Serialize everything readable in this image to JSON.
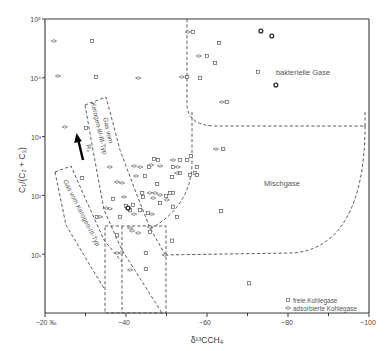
{
  "chart_data": {
    "type": "scatter",
    "title": "",
    "xlabel": "δ¹³CCH₄",
    "ylabel": "C₁/(C₂ + C₃)",
    "xlim": [
      -20,
      -100
    ],
    "ylim": [
      1,
      100000
    ],
    "yscale": "log",
    "grid": false,
    "legend_position": "bottom-right",
    "xtick_labels": [
      "−20 ‰",
      "−40",
      "−60",
      "−80",
      "−100"
    ],
    "xticks_major": [
      -20,
      -40,
      -60,
      -80,
      -100
    ],
    "xticks_minor": [
      -30,
      -50,
      -70,
      -90
    ],
    "ytick_labels": [
      "10⁵",
      "10⁴",
      "10³",
      "10²",
      "10¹"
    ],
    "yticks": [
      100000,
      10000,
      1000,
      100,
      10
    ],
    "legend": [
      {
        "symbol": "square",
        "label": "freie Kohlegase"
      },
      {
        "symbol": "diamond",
        "label": "adsorbierte Kohlegase"
      }
    ],
    "annotations": {
      "bacterial": "bakterielle Gase",
      "mixed": "Mischgase",
      "kerogen_2_3_line1": "Gas vom",
      "kerogen_2_3_line2": "Kerogen-II/-III-Typ",
      "kerogen_3": "Gas vom Kerogen-III-Typ",
      "maturity_arrow": "Rₒ"
    },
    "series": [
      {
        "name": "freie Kohlegase",
        "symbol": "square",
        "points": [
          [
            -31.6,
            42300
          ],
          [
            -32.6,
            10300
          ],
          [
            -55.1,
            10300
          ],
          [
            -56.5,
            60100
          ],
          [
            -63.0,
            39100
          ],
          [
            -60.0,
            23500
          ],
          [
            -62.0,
            17900
          ],
          [
            -58.3,
            9930
          ],
          [
            -72.6,
            12600
          ],
          [
            -64.9,
            3870
          ],
          [
            -64.0,
            615
          ],
          [
            -63.5,
            54
          ],
          [
            -30.1,
            1400
          ],
          [
            -29.1,
            198
          ],
          [
            -36.8,
            87
          ],
          [
            -32.8,
            43
          ],
          [
            -38.5,
            43
          ],
          [
            -46.9,
            416
          ],
          [
            -47.9,
            400
          ],
          [
            -45.7,
            304
          ],
          [
            -53.3,
            400
          ],
          [
            -55.1,
            400
          ],
          [
            -51.6,
            304
          ],
          [
            -53.3,
            240
          ],
          [
            -51.4,
            206
          ],
          [
            -44.7,
            214
          ],
          [
            -47.7,
            156
          ],
          [
            -44.0,
            110
          ],
          [
            -44.2,
            94
          ],
          [
            -50.9,
            110
          ],
          [
            -51.6,
            110
          ],
          [
            -49.9,
            98
          ],
          [
            -48.4,
            74
          ],
          [
            -51.6,
            64
          ],
          [
            -40.0,
            66
          ],
          [
            -41.0,
            56
          ],
          [
            -41.7,
            69
          ],
          [
            -43.5,
            56
          ],
          [
            -45.4,
            50
          ],
          [
            -52.6,
            43
          ],
          [
            -45.9,
            24
          ],
          [
            -37.8,
            21
          ],
          [
            -51.4,
            17
          ],
          [
            -44.9,
            10.5
          ],
          [
            -44.9,
            5.6
          ],
          [
            -70.4,
            3.2
          ],
          [
            -56.0,
            468
          ],
          [
            -57.5,
            304
          ],
          [
            -55.8,
            222
          ],
          [
            -57.0,
            240
          ],
          [
            -57.5,
            222
          ]
        ]
      },
      {
        "name": "adsorbierte Kohlegase",
        "symbol": "diamond",
        "points": [
          [
            -22.2,
            42300
          ],
          [
            -23.2,
            10700
          ],
          [
            -43.0,
            9930
          ],
          [
            -53.8,
            10300
          ],
          [
            -55.3,
            60100
          ],
          [
            -58.0,
            23500
          ],
          [
            -63.7,
            3870
          ],
          [
            -62.2,
            615
          ],
          [
            -24.9,
            1460
          ],
          [
            -36.0,
            304
          ],
          [
            -37.8,
            169
          ],
          [
            -35.1,
            61
          ],
          [
            -46.2,
            329
          ],
          [
            -43.5,
            304
          ],
          [
            -42.0,
            316
          ],
          [
            -48.4,
            316
          ],
          [
            -51.6,
            400
          ],
          [
            -52.8,
            304
          ],
          [
            -52.6,
            240
          ],
          [
            -39.0,
            163
          ],
          [
            -42.5,
            214
          ],
          [
            -45.9,
            110
          ],
          [
            -47.2,
            110
          ],
          [
            -48.4,
            102
          ],
          [
            -39.5,
            94
          ],
          [
            -46.7,
            90
          ],
          [
            -50.1,
            84
          ],
          [
            -40.5,
            61
          ],
          [
            -42.0,
            48
          ],
          [
            -36.0,
            59
          ],
          [
            -33.6,
            43
          ],
          [
            -46.4,
            48
          ],
          [
            -41.0,
            28
          ],
          [
            -43.0,
            23
          ],
          [
            -45.9,
            29
          ],
          [
            -41.5,
            25
          ],
          [
            -37.8,
            10.5
          ],
          [
            -38.8,
            10.5
          ],
          [
            -41.0,
            5.4
          ],
          [
            -49.6,
            9.7
          ]
        ]
      },
      {
        "name": "freie + adsorbierte (überlagert)",
        "symbol": "both",
        "points": [
          [
            -73.3,
            62500
          ],
          [
            -76.0,
            51400
          ],
          [
            -77.0,
            7550
          ],
          [
            -40.5,
            61
          ]
        ]
      }
    ]
  }
}
